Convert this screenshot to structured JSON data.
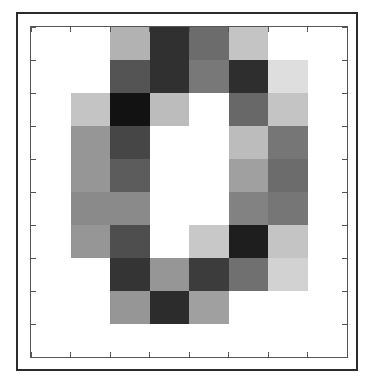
{
  "figure": {
    "title": "",
    "border_color": "#2b2b2b",
    "axes_color": "#555555",
    "background": "#ffffff"
  },
  "chart_data": {
    "type": "heatmap",
    "title": "",
    "xlabel": "",
    "ylabel": "",
    "colormap": "gray",
    "grid": false,
    "legend": "none",
    "n_cols": 8,
    "n_rows": 10,
    "xlim": [
      0,
      8
    ],
    "ylim": [
      0,
      10
    ],
    "x_ticks": [
      0,
      1,
      2,
      3,
      4,
      5,
      6,
      7,
      8
    ],
    "y_ticks": [
      0,
      1,
      2,
      3,
      4,
      5,
      6,
      7,
      8,
      9,
      10
    ],
    "x_tick_labels": [
      "",
      "",
      "",
      "",
      "",
      "",
      "",
      "",
      ""
    ],
    "y_tick_labels": [
      "",
      "",
      "",
      "",
      "",
      "",
      "",
      "",
      "",
      "",
      ""
    ],
    "value_range": [
      0,
      255
    ],
    "value_description": "8-bit grayscale intensity, 0 = black, 255 = white",
    "row_labels": [
      "r0",
      "r1",
      "r2",
      "r3",
      "r4",
      "r5",
      "r6",
      "r7",
      "r8",
      "r9"
    ],
    "col_labels": [
      "c0",
      "c1",
      "c2",
      "c3",
      "c4",
      "c5",
      "c6",
      "c7"
    ],
    "values": [
      [
        255,
        255,
        178,
        48,
        108,
        196,
        255,
        255
      ],
      [
        255,
        255,
        84,
        48,
        120,
        46,
        222,
        255
      ],
      [
        255,
        196,
        18,
        188,
        255,
        104,
        196,
        255
      ],
      [
        255,
        150,
        70,
        255,
        255,
        188,
        118,
        255
      ],
      [
        255,
        150,
        92,
        255,
        255,
        160,
        108,
        255
      ],
      [
        255,
        138,
        138,
        255,
        255,
        130,
        118,
        255
      ],
      [
        255,
        150,
        78,
        255,
        200,
        30,
        196,
        255
      ],
      [
        255,
        255,
        52,
        150,
        60,
        112,
        210,
        255
      ],
      [
        255,
        255,
        150,
        44,
        160,
        255,
        255,
        255
      ],
      [
        255,
        255,
        255,
        255,
        255,
        255,
        255,
        255
      ]
    ],
    "colors": [
      [
        "#ffffff",
        "#ffffff",
        "#b2b2b2",
        "#303030",
        "#6c6c6c",
        "#c4c4c4",
        "#ffffff",
        "#ffffff"
      ],
      [
        "#ffffff",
        "#ffffff",
        "#545454",
        "#303030",
        "#787878",
        "#2e2e2e",
        "#dedede",
        "#ffffff"
      ],
      [
        "#ffffff",
        "#c4c4c4",
        "#121212",
        "#bcbcbc",
        "#ffffff",
        "#686868",
        "#c4c4c4",
        "#ffffff"
      ],
      [
        "#ffffff",
        "#969696",
        "#464646",
        "#ffffff",
        "#ffffff",
        "#bcbcbc",
        "#767676",
        "#ffffff"
      ],
      [
        "#ffffff",
        "#969696",
        "#5c5c5c",
        "#ffffff",
        "#ffffff",
        "#a0a0a0",
        "#6c6c6c",
        "#ffffff"
      ],
      [
        "#ffffff",
        "#8a8a8a",
        "#8a8a8a",
        "#ffffff",
        "#ffffff",
        "#828282",
        "#767676",
        "#ffffff"
      ],
      [
        "#ffffff",
        "#969696",
        "#4e4e4e",
        "#ffffff",
        "#c8c8c8",
        "#1e1e1e",
        "#c4c4c4",
        "#ffffff"
      ],
      [
        "#ffffff",
        "#ffffff",
        "#343434",
        "#969696",
        "#3c3c3c",
        "#707070",
        "#d2d2d2",
        "#ffffff"
      ],
      [
        "#ffffff",
        "#ffffff",
        "#969696",
        "#2c2c2c",
        "#a0a0a0",
        "#ffffff",
        "#ffffff",
        "#ffffff"
      ],
      [
        "#ffffff",
        "#ffffff",
        "#ffffff",
        "#ffffff",
        "#ffffff",
        "#ffffff",
        "#ffffff",
        "#ffffff"
      ]
    ]
  }
}
